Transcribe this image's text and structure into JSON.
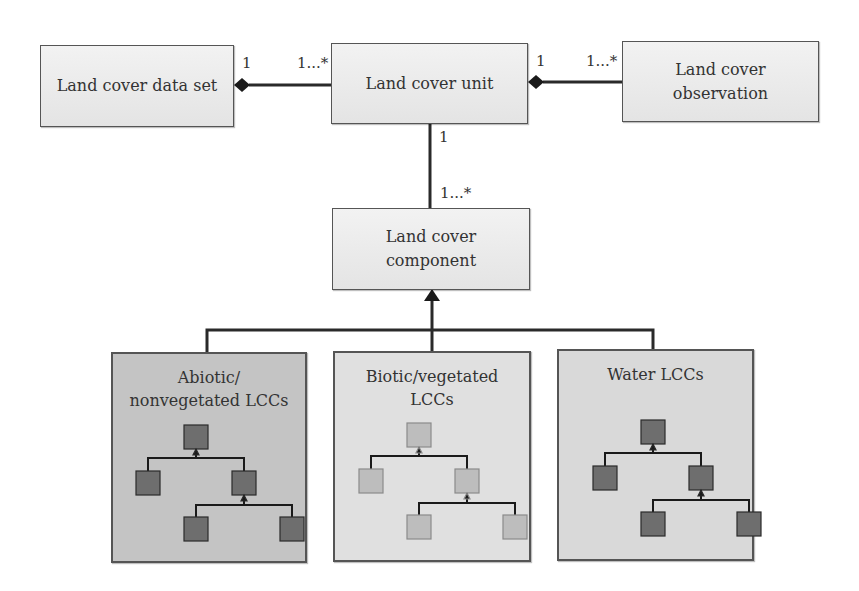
{
  "classes": {
    "dataset": {
      "label": "Land cover data set"
    },
    "unit": {
      "label": "Land cover unit"
    },
    "observation": {
      "label": "Land cover\nobservation"
    },
    "component": {
      "label": "Land cover\ncomponent"
    }
  },
  "multiplicities": {
    "dataset_unit_left": "1",
    "dataset_unit_right": "1...*",
    "unit_obs_left": "1",
    "unit_obs_right": "1...*",
    "unit_comp_top": "1",
    "unit_comp_bottom": "1...*"
  },
  "groups": [
    {
      "label": "Abiotic/\nnonvegetated LCCs",
      "fill": "#c4c4c4",
      "node_fill": "#6e6e6e"
    },
    {
      "label": "Biotic/vegetated\nLCCs",
      "fill": "#e0e0e0",
      "node_fill": "#bdbdbd"
    },
    {
      "label": "Water LCCs",
      "fill": "#d9d9d9",
      "node_fill": "#6e6e6e"
    }
  ],
  "colors": {
    "line": "#2a2a2a",
    "border": "#555555"
  }
}
